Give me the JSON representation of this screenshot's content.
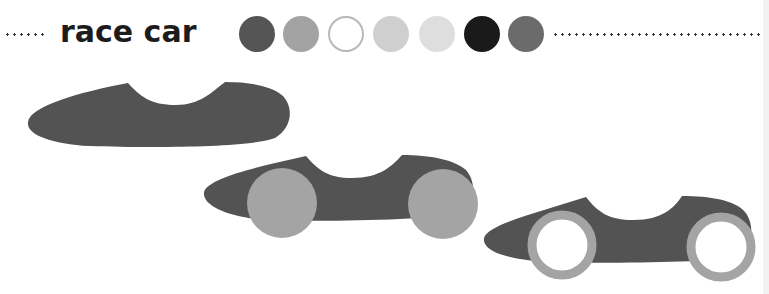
{
  "title": "race car",
  "palette": [
    {
      "name": "dark-gray",
      "color": "#555555"
    },
    {
      "name": "mid-gray",
      "color": "#a3a3a3"
    },
    {
      "name": "white",
      "color": "#ffffff",
      "border": "#b8b8b8"
    },
    {
      "name": "light-gray",
      "color": "#cfcfcf"
    },
    {
      "name": "lighter-gray",
      "color": "#dedede"
    },
    {
      "name": "black",
      "color": "#1a1a1a"
    },
    {
      "name": "slate-gray",
      "color": "#6b6b6b"
    }
  ],
  "steps": [
    {
      "step": 1,
      "label": "car body"
    },
    {
      "step": 2,
      "label": "car body with solid wheels"
    },
    {
      "step": 3,
      "label": "car body with ring wheels"
    }
  ],
  "colors": {
    "body": "#535353",
    "wheel": "#a4a4a4",
    "tire_inner": "#ffffff"
  }
}
